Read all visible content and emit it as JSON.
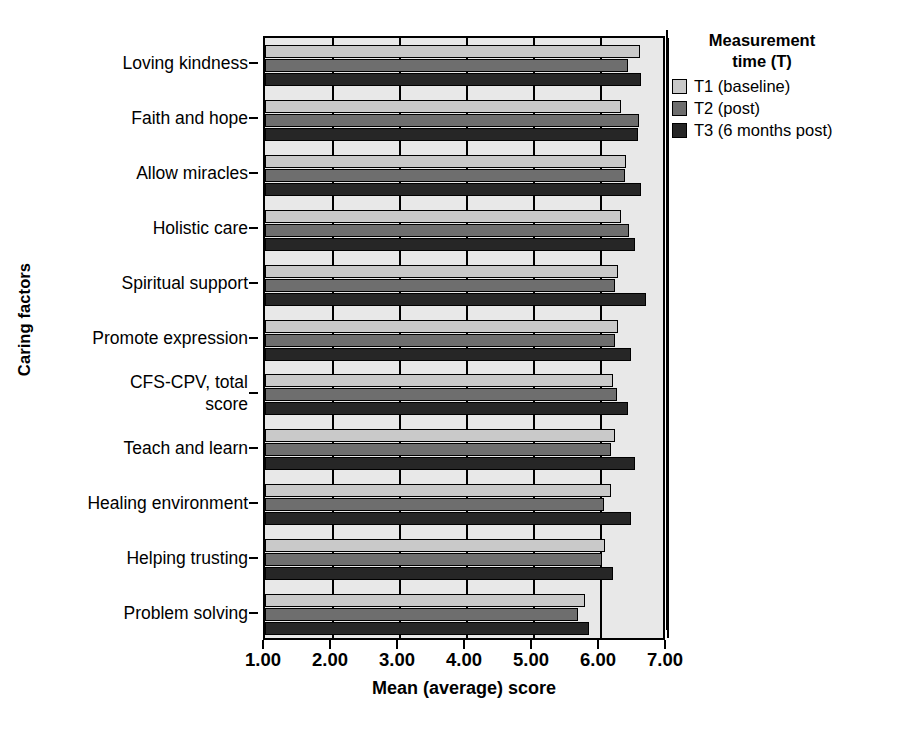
{
  "chart_data": {
    "type": "bar",
    "orientation": "horizontal",
    "title": "",
    "xlabel": "Mean (average) score",
    "ylabel": "Caring factors",
    "xlim": [
      1.0,
      7.0
    ],
    "xticks": [
      "1.00",
      "2.00",
      "3.00",
      "4.00",
      "5.00",
      "6.00",
      "7.00"
    ],
    "grid": true,
    "legend_position": "right",
    "legend_title": "Measurement time (T)",
    "categories": [
      "Loving kindness",
      "Faith and hope",
      "Allow miracles",
      "Holistic care",
      "Spiritual support",
      "Promote expression",
      "CFS-CPV, total\nscore",
      "Teach and learn",
      "Healing environment",
      "Helping trusting",
      "Problem solving"
    ],
    "series": [
      {
        "name": "T1 (baseline)",
        "color": "#c9c9c9",
        "values": [
          6.59,
          6.31,
          6.39,
          6.31,
          6.27,
          6.27,
          6.19,
          6.22,
          6.16,
          6.08,
          5.77
        ]
      },
      {
        "name": "T2 (post)",
        "color": "#6e6e6e",
        "values": [
          6.42,
          6.58,
          6.37,
          6.44,
          6.22,
          6.22,
          6.25,
          6.16,
          6.06,
          6.03,
          5.67
        ]
      },
      {
        "name": "T3 (6 months post)",
        "color": "#262626",
        "values": [
          6.61,
          6.56,
          6.61,
          6.52,
          6.69,
          6.47,
          6.42,
          6.52,
          6.47,
          6.19,
          5.83
        ]
      }
    ]
  },
  "axes": {
    "x_title": "Mean (average) score",
    "y_title": "Caring factors"
  },
  "legend": {
    "title_line1": "Measurement",
    "title_line2": "time (T)",
    "entries": [
      {
        "label": "T1 (baseline)"
      },
      {
        "label": "T2 (post)"
      },
      {
        "label": "T3 (6 months post)"
      }
    ]
  },
  "caption": {
    "text": ""
  }
}
